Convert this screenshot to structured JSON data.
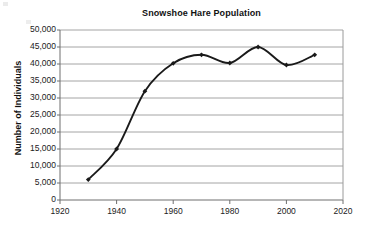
{
  "chart_data": {
    "type": "line",
    "title": "Snowshoe Hare Population",
    "xlabel": "",
    "ylabel": "Number of Individuals",
    "xlim": [
      1920,
      2020
    ],
    "ylim": [
      0,
      50000
    ],
    "grid": true,
    "legend": "none",
    "marker": "diamond",
    "line_color": "#1a1a1a",
    "x": [
      1930,
      1940,
      1950,
      1960,
      1970,
      1980,
      1990,
      2000,
      2010
    ],
    "values": [
      6000,
      15000,
      32000,
      40200,
      42700,
      40300,
      45000,
      39700,
      42700
    ],
    "series": [
      {
        "name": "Snowshoe Hare Population",
        "values": [
          6000,
          15000,
          32000,
          40200,
          42700,
          40300,
          45000,
          39700,
          42700
        ]
      }
    ],
    "xticks": [
      1920,
      1940,
      1960,
      1980,
      2000,
      2020
    ],
    "xtick_labels": [
      "1920",
      "1940",
      "1960",
      "1980",
      "2000",
      "2020"
    ],
    "yticks": [
      0,
      5000,
      10000,
      15000,
      20000,
      25000,
      30000,
      35000,
      40000,
      45000,
      50000
    ],
    "ytick_labels": [
      "0",
      "5,000",
      "10,000",
      "15,000",
      "20,000",
      "25,000",
      "30,000",
      "35,000",
      "40,000",
      "45,000",
      "50,000"
    ]
  },
  "colors": {
    "background": "#ffffff",
    "grid": "#9a9a9a",
    "axis": "#6e6e6e",
    "text": "#111111",
    "line": "#1a1a1a"
  }
}
